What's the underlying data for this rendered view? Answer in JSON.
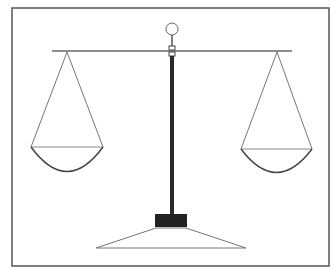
{
  "diagram": {
    "colors": {
      "background": "#ffffff",
      "frame": "#555555",
      "line": "#666666",
      "pole": "#2a2a2a",
      "base_block": "#222222"
    },
    "frame": {
      "x": 12,
      "y": 8,
      "width": 317,
      "height": 258
    },
    "knob": {
      "cx": 172,
      "cy": 29,
      "r": 6
    },
    "beam": {
      "x1": 52,
      "x2": 292,
      "y": 51
    },
    "pole": {
      "x": 169,
      "y_top": 46,
      "y_bottom": 214,
      "width": 5
    },
    "left_pan": {
      "apex_x": 67,
      "apex_y": 52,
      "rim_x1": 31,
      "rim_x2": 103,
      "rim_y": 147,
      "bottom_y": 171
    },
    "right_pan": {
      "apex_x": 277,
      "apex_y": 52,
      "rim_x1": 241,
      "rim_x2": 312,
      "rim_y": 149,
      "bottom_y": 172
    },
    "base_block": {
      "x": 155,
      "y": 214,
      "width": 32,
      "height": 13
    },
    "base_platform": {
      "top_x1": 156,
      "top_x2": 186,
      "top_y": 228,
      "bottom_x1": 96,
      "bottom_x2": 246,
      "bottom_y": 248
    }
  }
}
